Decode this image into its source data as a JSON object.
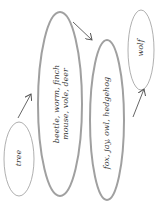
{
  "diagram": {
    "type": "food-chain",
    "colors": {
      "outline": "#8a8a8a",
      "outline_thick": "#9a9a9a",
      "text": "#3a3a3a",
      "arrow": "#555555"
    },
    "nodes": [
      {
        "id": "tree",
        "label": "tree"
      },
      {
        "id": "primary",
        "label_line1": "beetle, worm, finch",
        "label_line2": "mouse, vole, deer"
      },
      {
        "id": "secondary",
        "label": "fox, jay, owl, hedgehog"
      },
      {
        "id": "wolf",
        "label": "wolf"
      }
    ],
    "edges": [
      {
        "from": "tree",
        "to": "primary"
      },
      {
        "from": "primary",
        "to": "secondary"
      },
      {
        "from": "secondary",
        "to": "wolf"
      }
    ]
  }
}
